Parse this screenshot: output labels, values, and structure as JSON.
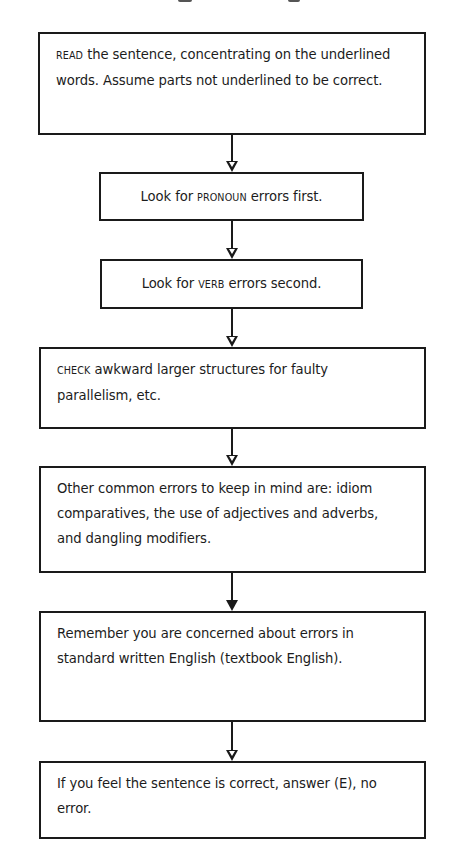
{
  "diagram": {
    "type": "flowchart",
    "direction": "top-to-bottom",
    "colors": {
      "line": "#1a1a1a",
      "text": "#1c1c1c",
      "background": "#ffffff"
    },
    "steps": [
      {
        "id": "read",
        "keyword": "READ",
        "text": " the sentence, concentrating on the underlined words. Assume parts not underlined to be correct."
      },
      {
        "id": "pronoun",
        "prefix": "Look for ",
        "keyword": "PRONOUN",
        "suffix": " errors first."
      },
      {
        "id": "verb",
        "prefix": "Look for ",
        "keyword": "VERB",
        "suffix": " errors second."
      },
      {
        "id": "check",
        "keyword": "CHECK",
        "text": " awkward larger structures for faulty parallelism, etc."
      },
      {
        "id": "other",
        "text": "Other common errors to keep in mind are: idiom comparatives, the use of adjectives and adverbs, and dangling modifiers."
      },
      {
        "id": "remember",
        "text": "Remember you are concerned about errors in standard written English (textbook English)."
      },
      {
        "id": "correct",
        "text": "If you feel the sentence is correct, answer (E), no error."
      }
    ],
    "arrows": [
      {
        "from": "read",
        "to": "pronoun",
        "head": "hollow"
      },
      {
        "from": "pronoun",
        "to": "verb",
        "head": "hollow"
      },
      {
        "from": "verb",
        "to": "check",
        "head": "hollow"
      },
      {
        "from": "check",
        "to": "other",
        "head": "hollow"
      },
      {
        "from": "other",
        "to": "remember",
        "head": "filled"
      },
      {
        "from": "remember",
        "to": "correct",
        "head": "hollow"
      }
    ]
  }
}
